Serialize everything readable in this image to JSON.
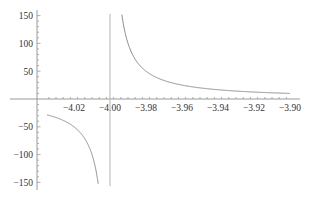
{
  "chart_data": {
    "type": "line",
    "title": "",
    "xlabel": "",
    "ylabel": "",
    "function": "1/(x+4)",
    "xlim": [
      -4.035,
      -3.9
    ],
    "ylim": [
      -160,
      160
    ],
    "grid": false,
    "legend": null,
    "x_ticks": [
      "-4.02",
      "-4.00",
      "-3.98",
      "-3.96",
      "-3.94",
      "-3.92",
      "-3.90"
    ],
    "y_ticks": [
      "150",
      "100",
      "50",
      "-50",
      "-100",
      "-150"
    ],
    "asymptote": {
      "x": -4.0
    },
    "series": [
      {
        "name": "f(x)",
        "color": "#8a8a8a",
        "x": [
          -4.035,
          -4.03,
          -4.025,
          -4.02,
          -4.015,
          -4.01,
          -4.008,
          -4.0065,
          -3.9935,
          -3.992,
          -3.99,
          -3.985,
          -3.98,
          -3.97,
          -3.96,
          -3.95,
          -3.94,
          -3.93,
          -3.92,
          -3.91,
          -3.9
        ],
        "y": [
          -28.6,
          -33.3,
          -40,
          -50,
          -66.7,
          -100,
          -125,
          -153.8,
          153.8,
          125,
          100,
          66.7,
          50,
          33.3,
          25,
          20,
          16.7,
          14.3,
          12.5,
          11.1,
          10
        ]
      }
    ]
  }
}
